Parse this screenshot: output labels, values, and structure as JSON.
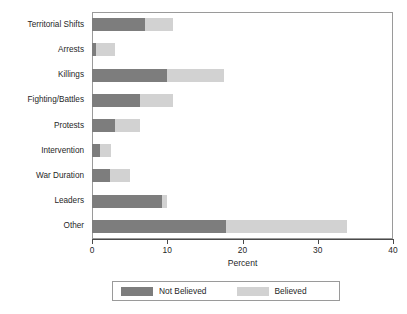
{
  "chart_data": {
    "type": "bar",
    "orientation": "horizontal",
    "stacked": true,
    "title": "",
    "xlabel": "Percent",
    "ylabel": "",
    "xlim": [
      0,
      40
    ],
    "xticks": [
      0,
      10,
      20,
      30,
      40
    ],
    "xticklabels": [
      "0",
      "10",
      "20",
      "30",
      "40"
    ],
    "grid": false,
    "legend_position": "bottom",
    "categories": [
      "Territorial Shifts",
      "Arrests",
      "Killings",
      "Fighting/Battles",
      "Protests",
      "Intervention",
      "War Duration",
      "Leaders",
      "Other"
    ],
    "series": [
      {
        "name": "Not Believed",
        "color": "#7d7d7d",
        "values": [
          7.0,
          0.5,
          10.0,
          6.4,
          3.1,
          1.1,
          2.4,
          9.3,
          17.8
        ]
      },
      {
        "name": "Believed",
        "color": "#d2d2d2",
        "values": [
          3.7,
          2.5,
          7.6,
          4.3,
          3.3,
          1.4,
          2.6,
          0.7,
          16.1
        ]
      }
    ],
    "totals": [
      10.7,
      3.0,
      17.6,
      10.7,
      6.4,
      2.5,
      5.0,
      10.0,
      33.9
    ]
  },
  "axis": {
    "x_title": "Percent",
    "tick_labels": [
      "0",
      "10",
      "20",
      "30",
      "40"
    ]
  },
  "legend": {
    "entries": [
      {
        "label": "Not Believed",
        "color": "#7d7d7d"
      },
      {
        "label": "Believed",
        "color": "#d2d2d2"
      }
    ]
  },
  "colors": {
    "not_believed": "#7d7d7d",
    "believed": "#d2d2d2",
    "frame": "#9a9a9a",
    "axis": "#4a4a4a",
    "text": "#1f1f1f",
    "background": "#ffffff"
  }
}
